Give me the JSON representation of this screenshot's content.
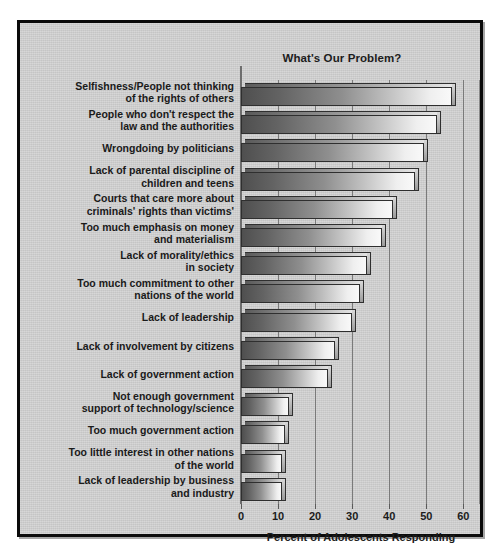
{
  "figure": {
    "background_color": "#ffffff",
    "panel_color": "#c9c9c9",
    "border_color": "#0a0a0a"
  },
  "chart_data": {
    "type": "bar",
    "orientation": "horizontal",
    "title": "What's Our Problem?",
    "xlabel": "Percent of Adolescents Responding",
    "ylabel": "",
    "xlim": [
      0,
      65
    ],
    "xticks": [
      0,
      10,
      20,
      30,
      40,
      50,
      60
    ],
    "xtick_labels": [
      "0",
      "10",
      "20",
      "30",
      "40",
      "50",
      "60"
    ],
    "grid": true,
    "legend": null,
    "bar_style": "3d-gradient",
    "categories": [
      "Selfishness/People not thinking of the rights of others",
      "People who don't respect the law and the authorities",
      "Wrongdoing by politicians",
      "Lack of parental discipline of children and teens",
      "Courts that care more about criminals' rights than victims'",
      "Too much emphasis on money and materialism",
      "Lack of morality/ethics in society",
      "Too much commitment to other nations of the world",
      "Lack of leadership",
      "Lack of involvement by citizens",
      "Lack of government action",
      "Not enough government support of technology/science",
      "Too much government action",
      "Too little interest in other nations of the world",
      "Lack of leadership by business and industry"
    ],
    "category_lines": [
      [
        "Selfishness/People not thinking",
        "of the rights of others"
      ],
      [
        "People who don't respect the",
        "law and the authorities"
      ],
      [
        "Wrongdoing by politicians"
      ],
      [
        "Lack of parental discipline of",
        "children and teens"
      ],
      [
        "Courts that care more about",
        "criminals' rights than victims'"
      ],
      [
        "Too much emphasis on money",
        "and materialism"
      ],
      [
        "Lack of morality/ethics",
        "in society"
      ],
      [
        "Too much commitment to other",
        "nations of the world"
      ],
      [
        "Lack of leadership"
      ],
      [
        "Lack of involvement by citizens"
      ],
      [
        "Lack of government action"
      ],
      [
        "Not enough government",
        "support of technology/science"
      ],
      [
        "Too much government action"
      ],
      [
        "Too little interest in other nations",
        "of the world"
      ],
      [
        "Lack of leadership by business",
        "and industry"
      ]
    ],
    "values": [
      57,
      53,
      49.5,
      47,
      41,
      38,
      34,
      32,
      30,
      25.5,
      23.5,
      13,
      12,
      11,
      11
    ]
  }
}
